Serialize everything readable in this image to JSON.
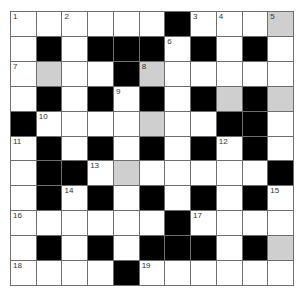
{
  "puzzle": {
    "type": "crossword",
    "rows": 11,
    "cols": 11,
    "colors": {
      "white": "#ffffff",
      "black": "#000000",
      "shaded": "#cfcfcf",
      "line": "#6e6e6e"
    },
    "legend": {
      "W": "white",
      "B": "black",
      "G": "shaded"
    },
    "grid": [
      "WWWWWWBWWWG",
      "WBWBBBWBWBW",
      "WGWWBGWWWWW",
      "WBWBWBWBGBG",
      "BWWWWGWWBBW",
      "WBWBWBWBWBW",
      "WBBWGWWWWWB",
      "WBWBWBWBWBW",
      "WWWWWWBWWWW",
      "WBWBWBBBWBG",
      "WWWWBWWWWWW"
    ],
    "numbers": [
      {
        "r": 0,
        "c": 0,
        "n": "1"
      },
      {
        "r": 0,
        "c": 2,
        "n": "2"
      },
      {
        "r": 0,
        "c": 7,
        "n": "3"
      },
      {
        "r": 0,
        "c": 8,
        "n": "4"
      },
      {
        "r": 0,
        "c": 10,
        "n": "5"
      },
      {
        "r": 1,
        "c": 6,
        "n": "6"
      },
      {
        "r": 2,
        "c": 0,
        "n": "7"
      },
      {
        "r": 2,
        "c": 5,
        "n": "8"
      },
      {
        "r": 3,
        "c": 4,
        "n": "9"
      },
      {
        "r": 4,
        "c": 1,
        "n": "10"
      },
      {
        "r": 5,
        "c": 0,
        "n": "11"
      },
      {
        "r": 5,
        "c": 8,
        "n": "12"
      },
      {
        "r": 6,
        "c": 3,
        "n": "13"
      },
      {
        "r": 7,
        "c": 2,
        "n": "14"
      },
      {
        "r": 7,
        "c": 10,
        "n": "15"
      },
      {
        "r": 8,
        "c": 0,
        "n": "16"
      },
      {
        "r": 8,
        "c": 7,
        "n": "17"
      },
      {
        "r": 10,
        "c": 0,
        "n": "18"
      },
      {
        "r": 10,
        "c": 5,
        "n": "19"
      }
    ]
  }
}
